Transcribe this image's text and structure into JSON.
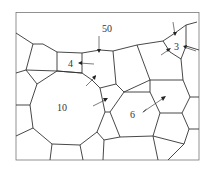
{
  "figure": {
    "labels": {
      "top_boundary_grain": "50",
      "small_square_grain": "4",
      "small_triangular_grain": "3",
      "large_grain": "10",
      "hexagonal_grain": "6"
    },
    "colors": {
      "boundary": "#333333",
      "frame": "#777777",
      "background": "#ffffff"
    }
  }
}
